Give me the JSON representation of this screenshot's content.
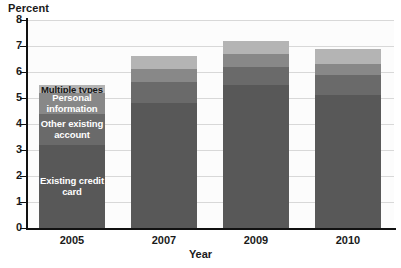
{
  "chart_data": {
    "type": "bar",
    "subtype": "stacked-bar",
    "title": "",
    "xlabel": "Year",
    "ylabel": "Percent",
    "categories": [
      "2005",
      "2007",
      "2009",
      "2010"
    ],
    "ylim": [
      0,
      8
    ],
    "yticks": [
      0,
      1,
      2,
      3,
      4,
      5,
      6,
      7,
      8
    ],
    "ytick_labels": [
      "0",
      "1",
      "2",
      "3",
      "4",
      "5",
      "6",
      "7",
      "8"
    ],
    "grid": true,
    "legend_position": "in-bar-2005",
    "series": [
      {
        "name": "Existing credit card",
        "color": "#585858",
        "label_color": "#ffffff",
        "values": [
          3.2,
          4.8,
          5.5,
          5.1
        ]
      },
      {
        "name": "Other existing account",
        "color": "#6a6a6a",
        "label_color": "#ffffff",
        "values": [
          1.2,
          0.8,
          0.7,
          0.8
        ]
      },
      {
        "name": "Personal information",
        "color": "#888888",
        "label_color": "#ffffff",
        "values": [
          0.8,
          0.5,
          0.5,
          0.4
        ]
      },
      {
        "name": "Multiple types",
        "color": "#b4b4b4",
        "label_color": "#151515",
        "values": [
          0.3,
          0.5,
          0.5,
          0.6
        ]
      }
    ],
    "totals": [
      5.5,
      6.6,
      7.2,
      6.9
    ]
  },
  "axis": {
    "y_title": "Percent",
    "x_title": "Year"
  },
  "legend": {
    "items": [
      {
        "label": "Multiple types",
        "color": "#b4b4b4"
      },
      {
        "label": "Personal information",
        "color": "#888888"
      },
      {
        "label": "Other existing account",
        "color": "#6a6a6a"
      },
      {
        "label": "Existing credit card",
        "color": "#585858"
      }
    ]
  }
}
